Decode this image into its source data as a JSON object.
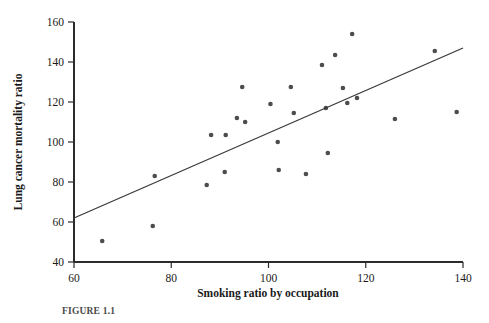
{
  "figure": {
    "caption": "FIGURE 1.1",
    "background_color": "#ffffff",
    "point_color": "#4d4d4d",
    "line_color": "#3a3a3a",
    "axis_color": "#2b2b2b"
  },
  "chart_data": {
    "type": "scatter",
    "title": "",
    "xlabel": "Smoking ratio by occupation",
    "ylabel": "Lung cancer mortality ratio",
    "xlim": [
      60,
      140
    ],
    "ylim": [
      40,
      160
    ],
    "xticks": [
      60,
      80,
      100,
      120,
      140
    ],
    "yticks": [
      40,
      60,
      80,
      100,
      120,
      140,
      160
    ],
    "grid": false,
    "legend": "none",
    "series": [
      {
        "name": "Occupational groups",
        "marker": "circle",
        "points": [
          {
            "x": 65.8,
            "y": 50.5
          },
          {
            "x": 76.2,
            "y": 58.0
          },
          {
            "x": 76.6,
            "y": 83.0
          },
          {
            "x": 87.3,
            "y": 78.5
          },
          {
            "x": 88.2,
            "y": 103.5
          },
          {
            "x": 91.0,
            "y": 85.0
          },
          {
            "x": 91.2,
            "y": 103.5
          },
          {
            "x": 93.5,
            "y": 112.0
          },
          {
            "x": 94.6,
            "y": 127.5
          },
          {
            "x": 95.2,
            "y": 110.0
          },
          {
            "x": 100.4,
            "y": 119.0
          },
          {
            "x": 101.9,
            "y": 100.0
          },
          {
            "x": 102.1,
            "y": 86.0
          },
          {
            "x": 104.6,
            "y": 127.5
          },
          {
            "x": 105.2,
            "y": 114.5
          },
          {
            "x": 107.7,
            "y": 84.0
          },
          {
            "x": 111.0,
            "y": 138.5
          },
          {
            "x": 111.8,
            "y": 117.0
          },
          {
            "x": 112.2,
            "y": 94.5
          },
          {
            "x": 113.7,
            "y": 143.5
          },
          {
            "x": 115.3,
            "y": 127.0
          },
          {
            "x": 116.2,
            "y": 119.5
          },
          {
            "x": 117.2,
            "y": 154.0
          },
          {
            "x": 118.2,
            "y": 122.0
          },
          {
            "x": 126.0,
            "y": 111.5
          },
          {
            "x": 134.2,
            "y": 145.5
          },
          {
            "x": 138.7,
            "y": 115.0
          }
        ]
      }
    ],
    "fit_line": {
      "name": "least-squares regression line",
      "x_start": 60,
      "y_start": 62,
      "x_end": 140,
      "y_end": 147
    }
  }
}
